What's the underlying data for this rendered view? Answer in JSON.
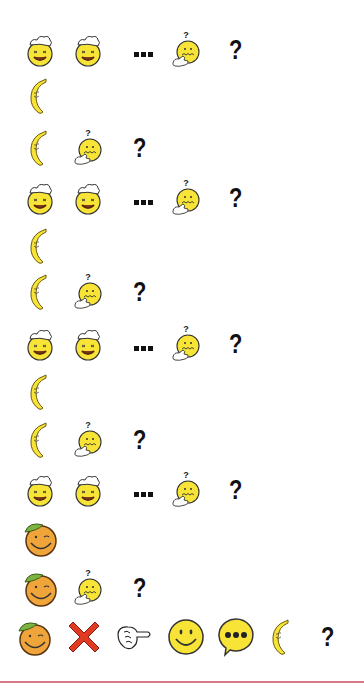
{
  "puzzle": {
    "rows": [
      {
        "y": 28,
        "items": [
          "chef-smiley",
          "chef-smiley",
          "ellipsis",
          "thinking-smiley",
          "question-mark"
        ]
      },
      {
        "y": 74,
        "items": [
          "banana"
        ]
      },
      {
        "y": 126,
        "items": [
          "banana",
          "thinking-smiley",
          "question-mark"
        ]
      },
      {
        "y": 176,
        "items": [
          "chef-smiley",
          "chef-smiley",
          "ellipsis",
          "thinking-smiley",
          "question-mark"
        ]
      },
      {
        "y": 224,
        "items": [
          "banana"
        ]
      },
      {
        "y": 270,
        "items": [
          "banana",
          "thinking-smiley",
          "question-mark"
        ]
      },
      {
        "y": 322,
        "items": [
          "chef-smiley",
          "chef-smiley",
          "ellipsis",
          "thinking-smiley",
          "question-mark"
        ]
      },
      {
        "y": 370,
        "items": [
          "banana"
        ]
      },
      {
        "y": 418,
        "items": [
          "banana",
          "thinking-smiley",
          "question-mark"
        ]
      },
      {
        "y": 468,
        "items": [
          "chef-smiley",
          "chef-smiley",
          "ellipsis",
          "thinking-smiley",
          "question-mark"
        ]
      },
      {
        "y": 516,
        "items": [
          "orange-smiley"
        ]
      },
      {
        "y": 566,
        "items": [
          "orange-smiley",
          "thinking-smiley",
          "question-mark"
        ]
      },
      {
        "y": 615,
        "items": [
          "orange-smiley",
          "red-x",
          "pointing-hand",
          "smiley-face",
          "speech-bubble",
          "banana",
          "question-mark"
        ]
      }
    ],
    "question_mark_text": "?",
    "colors": {
      "smiley_yellow": "#f7e436",
      "orange": "#f0a53a",
      "leaf": "#7cb342",
      "red_x": "#e03a22",
      "divider": "#d9768a"
    }
  }
}
